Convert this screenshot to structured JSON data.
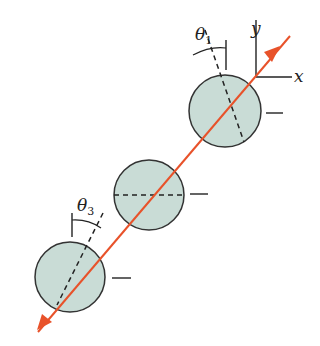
{
  "diagram": {
    "type": "polarizer-sequence",
    "colors": {
      "beam": "#e8522a",
      "disk_fill": "#c9dcd6",
      "disk_stroke": "#333333",
      "line": "#222222"
    },
    "axes": {
      "x_label": "x",
      "y_label": "y"
    },
    "angles": [
      {
        "symbol": "θ",
        "subscript": "1"
      },
      {
        "symbol": "θ",
        "subscript": "3"
      }
    ],
    "disks": [
      {
        "name": "polarizing-sheet-1",
        "axis": "tilted θ1 from vertical"
      },
      {
        "name": "polarizing-sheet-2",
        "axis": "horizontal"
      },
      {
        "name": "polarizing-sheet-3",
        "axis": "tilted θ3 from vertical"
      }
    ]
  }
}
